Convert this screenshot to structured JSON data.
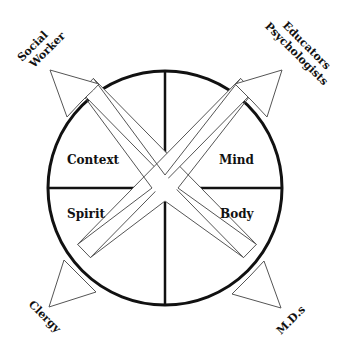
{
  "diagram": {
    "type": "four-quadrant circle with diagonal arrows",
    "colors": {
      "stroke": "#111111",
      "arrow_stroke": "#555555",
      "fill": "#ffffff"
    },
    "quadrants": {
      "top_left": "Context",
      "top_right": "Mind",
      "bottom_left": "Spirit",
      "bottom_right": "Body"
    },
    "arrows": {
      "top_left": "Social Worker",
      "top_left_lines": [
        "Social",
        "Worker"
      ],
      "top_right": "Educators Psychologists",
      "top_right_lines": [
        "Educators",
        "Psychologists"
      ],
      "bottom_left": "Clergy",
      "bottom_right": "M.D.s"
    }
  }
}
